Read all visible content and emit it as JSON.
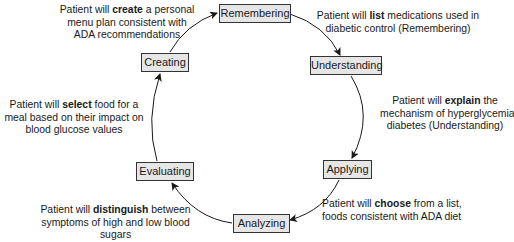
{
  "stages": [
    {
      "label": "Remembering"
    },
    {
      "label": "Understanding"
    },
    {
      "label": "Applying"
    },
    {
      "label": "Analyzing"
    },
    {
      "label": "Evaluating"
    },
    {
      "label": "Creating"
    }
  ],
  "objectives": [
    {
      "lines": [
        {
          "pre": "Patient will ",
          "verb": "list",
          "post": " medications used in"
        },
        {
          "pre": "diabetic control (Remembering)",
          "verb": "",
          "post": ""
        }
      ]
    },
    {
      "lines": [
        {
          "pre": "Patient will ",
          "verb": "explain",
          "post": " the"
        },
        {
          "pre": "mechanism of hyperglycemia in",
          "verb": "",
          "post": ""
        },
        {
          "pre": "diabetes (Understanding)",
          "verb": "",
          "post": ""
        }
      ]
    },
    {
      "lines": [
        {
          "pre": "Patient will ",
          "verb": "choose",
          "post": " from a list,"
        },
        {
          "pre": "foods consistent with ADA diet",
          "verb": "",
          "post": ""
        }
      ]
    },
    {
      "lines": [
        {
          "pre": "Patient will ",
          "verb": "distinguish",
          "post": " between"
        },
        {
          "pre": "symptoms of high and low blood",
          "verb": "",
          "post": ""
        },
        {
          "pre": "sugars",
          "verb": "",
          "post": ""
        }
      ]
    },
    {
      "lines": [
        {
          "pre": "Patient will ",
          "verb": "select",
          "post": " food for a"
        },
        {
          "pre": "meal based on their impact on",
          "verb": "",
          "post": ""
        },
        {
          "pre": "blood glucose values",
          "verb": "",
          "post": ""
        }
      ]
    },
    {
      "lines": [
        {
          "pre": "Patient will ",
          "verb": "create",
          "post": " a personal"
        },
        {
          "pre": "menu plan consistent with",
          "verb": "",
          "post": ""
        },
        {
          "pre": "ADA recommendations",
          "verb": "",
          "post": ""
        }
      ]
    }
  ],
  "colors": {
    "box_fill": "#e6e6e6",
    "box_border": "#333333",
    "arrow": "#1a1a1a"
  }
}
